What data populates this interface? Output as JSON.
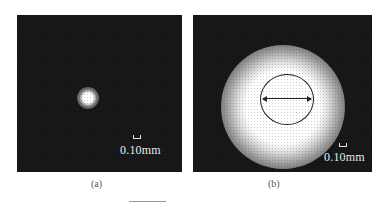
{
  "figure": {
    "panels": [
      {
        "id": "a",
        "caption": "(a)",
        "scale_label": "0.10mm",
        "description": "small bright circular spot centered on dark background"
      },
      {
        "id": "b",
        "caption": "(b)",
        "scale_label": "0.10mm",
        "description": "large bright circular spot with outlined circle and double-headed diameter arrow"
      }
    ],
    "colors": {
      "background": "#161616",
      "spot": "#ffffff",
      "annotation": "#1a1a1a"
    }
  }
}
